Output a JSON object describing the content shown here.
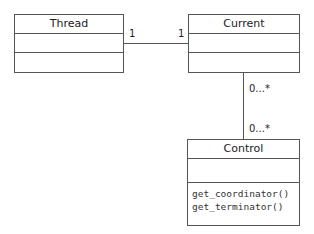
{
  "diagram": {
    "type": "uml-class-diagram",
    "classes": [
      {
        "name": "Thread",
        "attributes": [],
        "operations": []
      },
      {
        "name": "Current",
        "attributes": [],
        "operations": []
      },
      {
        "name": "Control",
        "attributes": [],
        "operations": [
          "get_coordinator()",
          "get_terminator()"
        ]
      }
    ],
    "associations": [
      {
        "from": "Thread",
        "to": "Current",
        "from_multiplicity": "1",
        "to_multiplicity": "1"
      },
      {
        "from": "Current",
        "to": "Control",
        "from_multiplicity": "0...*",
        "to_multiplicity": "0...*"
      }
    ]
  }
}
